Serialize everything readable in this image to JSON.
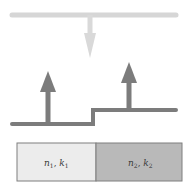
{
  "diagram": {
    "colors": {
      "incident": "#d6d6d6",
      "transmitted": "#7c7c7c",
      "medium1_fill": "#ececec",
      "medium2_fill": "#b9b9b9",
      "border": "#7f7f7f",
      "text": "#3a3a3a"
    },
    "media": [
      {
        "id": "medium-1",
        "n_symbol": "n",
        "n_sub": "1",
        "k_symbol": "k",
        "k_sub": "1",
        "separator": ", "
      },
      {
        "id": "medium-2",
        "n_symbol": "n",
        "n_sub": "2",
        "k_symbol": "k",
        "k_sub": "2",
        "separator": ", "
      }
    ]
  }
}
